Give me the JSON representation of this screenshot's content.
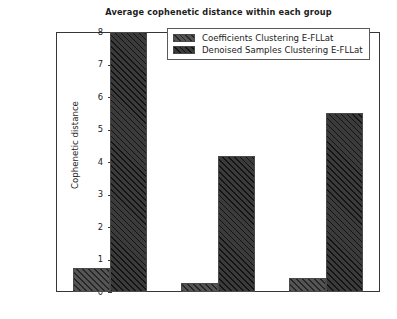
{
  "chart_data": {
    "type": "bar",
    "title": "Average cophenetic distance within each group",
    "xlabel": "",
    "ylabel": "Cophenetic distance",
    "categories": [
      "G1",
      "G2",
      "G3"
    ],
    "series": [
      {
        "name": "Coefficients Clustering E-FLLat",
        "values": [
          0.74,
          0.28,
          0.43
        ],
        "color": "#555555",
        "hatch": "diagonal"
      },
      {
        "name": "Denoised Samples Clustering E-FLLat",
        "values": [
          8.0,
          4.18,
          5.5
        ],
        "color": "#3b3b3b",
        "hatch": "diagonal"
      }
    ],
    "ylim": [
      0,
      8.0
    ],
    "yticks": [
      0,
      1,
      2,
      3,
      4,
      5,
      6,
      7,
      8
    ],
    "ytick_labels": [
      "0",
      "1",
      "2",
      "3",
      "4",
      "5",
      "6",
      "7",
      "8"
    ],
    "grid": false,
    "legend_position": "top-center",
    "frame": true
  },
  "axes": {
    "y_label": "Cophenetic distance"
  }
}
